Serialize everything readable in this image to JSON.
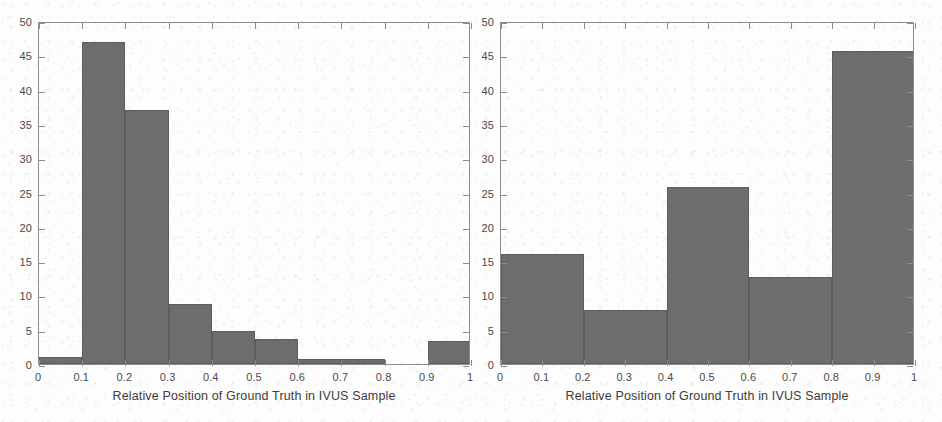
{
  "figure": {
    "background_color": "#fdfdfd",
    "bar_color": "#6d6d6d",
    "axis_color": "#8d8d8d",
    "text_color": "#4a4a4a"
  },
  "chart_data": [
    {
      "panel": "left",
      "type": "bar",
      "title": "",
      "xlabel": "Relative Position of Ground Truth in IVUS Sample",
      "ylabel": "",
      "xlim": [
        0,
        1
      ],
      "ylim": [
        0,
        50
      ],
      "grid": false,
      "legend": "none",
      "bin_width": 0.1,
      "bin_edges": [
        0,
        0.1,
        0.2,
        0.3,
        0.4,
        0.5,
        0.6,
        0.7,
        0.8,
        0.9,
        1
      ],
      "categories": [
        "0-0.1",
        "0.1-0.2",
        "0.2-0.3",
        "0.3-0.4",
        "0.4-0.5",
        "0.5-0.6",
        "0.6-0.7",
        "0.7-0.8",
        "0.8-0.9",
        "0.9-1"
      ],
      "values": [
        1,
        47,
        37,
        8.8,
        4.8,
        3.6,
        0.8,
        0.8,
        0,
        3.4
      ],
      "xticks": [
        "0",
        "0.1",
        "0.2",
        "0.3",
        "0.4",
        "0.5",
        "0.6",
        "0.7",
        "0.8",
        "0.9",
        "1"
      ],
      "xtick_values": [
        0,
        0.1,
        0.2,
        0.3,
        0.4,
        0.5,
        0.6,
        0.7,
        0.8,
        0.9,
        1
      ],
      "yticks": [
        "0",
        "5",
        "10",
        "15",
        "20",
        "25",
        "30",
        "35",
        "40",
        "45",
        "50"
      ],
      "ytick_values": [
        0,
        5,
        10,
        15,
        20,
        25,
        30,
        35,
        40,
        45,
        50
      ]
    },
    {
      "panel": "right",
      "type": "bar",
      "title": "",
      "xlabel": "Relative Position of Ground Truth in IVUS Sample",
      "ylabel": "",
      "xlim": [
        0,
        1
      ],
      "ylim": [
        0,
        50
      ],
      "grid": false,
      "legend": "none",
      "bin_width": 0.2,
      "bin_edges": [
        0,
        0.2,
        0.4,
        0.6,
        0.8,
        1
      ],
      "categories": [
        "0-0.2",
        "0.2-0.4",
        "0.4-0.6",
        "0.6-0.8",
        "0.8-1"
      ],
      "values": [
        16,
        7.9,
        25.8,
        12.7,
        45.6
      ],
      "xticks": [
        "0",
        "0.1",
        "0.2",
        "0.3",
        "0.4",
        "0.5",
        "0.6",
        "0.7",
        "0.8",
        "0.9",
        "1"
      ],
      "xtick_values": [
        0,
        0.1,
        0.2,
        0.3,
        0.4,
        0.5,
        0.6,
        0.7,
        0.8,
        0.9,
        1
      ],
      "yticks": [
        "0",
        "5",
        "10",
        "15",
        "20",
        "25",
        "30",
        "35",
        "40",
        "45",
        "50"
      ],
      "ytick_values": [
        0,
        5,
        10,
        15,
        20,
        25,
        30,
        35,
        40,
        45,
        50
      ]
    }
  ]
}
